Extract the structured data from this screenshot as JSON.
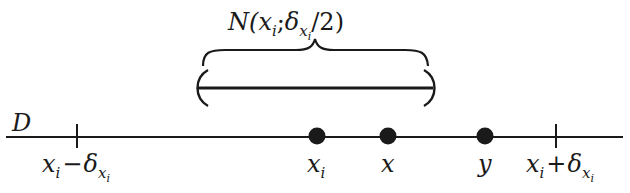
{
  "diagram": {
    "type": "number-line-neighborhood",
    "colors": {
      "ink": "#1a1a1a",
      "background": "#ffffff"
    },
    "line": {
      "label": "D"
    },
    "neighborhood": {
      "label_prefix": "N(",
      "label_center": "x",
      "label_center_sub": "i",
      "label_sep": ";",
      "label_delta": "δ",
      "label_delta_sub": "x",
      "label_delta_subsub": "i",
      "label_suffix": "/2)"
    },
    "ticks": [
      {
        "id": "left",
        "base": "x",
        "sub": "i",
        "op": "−",
        "delta": "δ",
        "delta_sub": "x",
        "delta_subsub": "i"
      },
      {
        "id": "right",
        "base": "x",
        "sub": "i",
        "op": "+",
        "delta": "δ",
        "delta_sub": "x",
        "delta_subsub": "i"
      }
    ],
    "points": [
      {
        "id": "xi",
        "base": "x",
        "sub": "i"
      },
      {
        "id": "x",
        "base": "x",
        "sub": ""
      },
      {
        "id": "y",
        "base": "y",
        "sub": ""
      }
    ]
  }
}
